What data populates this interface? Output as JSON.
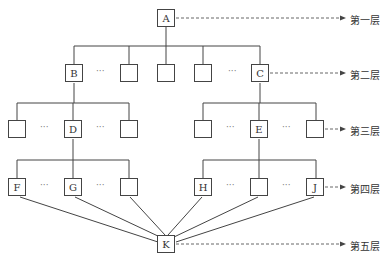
{
  "diagram": {
    "type": "hierarchy",
    "nodes": [
      {
        "id": "A",
        "label": "A",
        "x": 157,
        "y": 9
      },
      {
        "id": "B",
        "label": "B",
        "x": 65,
        "y": 64
      },
      {
        "id": "L2a",
        "label": "",
        "x": 120,
        "y": 64
      },
      {
        "id": "L2b",
        "label": "",
        "x": 157,
        "y": 64
      },
      {
        "id": "L2c",
        "label": "",
        "x": 194,
        "y": 64
      },
      {
        "id": "C",
        "label": "C",
        "x": 251,
        "y": 64
      },
      {
        "id": "L3a",
        "label": "",
        "x": 8,
        "y": 120
      },
      {
        "id": "D",
        "label": "D",
        "x": 64,
        "y": 120
      },
      {
        "id": "L3b",
        "label": "",
        "x": 120,
        "y": 120
      },
      {
        "id": "L3c",
        "label": "",
        "x": 194,
        "y": 120
      },
      {
        "id": "E",
        "label": "E",
        "x": 250,
        "y": 120
      },
      {
        "id": "L3d",
        "label": "",
        "x": 306,
        "y": 120
      },
      {
        "id": "F",
        "label": "F",
        "x": 8,
        "y": 178
      },
      {
        "id": "G",
        "label": "G",
        "x": 64,
        "y": 178
      },
      {
        "id": "L4a",
        "label": "",
        "x": 120,
        "y": 178
      },
      {
        "id": "H",
        "label": "H",
        "x": 194,
        "y": 178
      },
      {
        "id": "L4b",
        "label": "",
        "x": 250,
        "y": 178
      },
      {
        "id": "J",
        "label": "J",
        "x": 306,
        "y": 178
      },
      {
        "id": "K",
        "label": "K",
        "x": 157,
        "y": 235
      }
    ],
    "ellipses": [
      {
        "x": 96,
        "y": 66
      },
      {
        "x": 228,
        "y": 66
      },
      {
        "x": 40,
        "y": 122
      },
      {
        "x": 96,
        "y": 122
      },
      {
        "x": 226,
        "y": 122
      },
      {
        "x": 282,
        "y": 122
      },
      {
        "x": 40,
        "y": 180
      },
      {
        "x": 96,
        "y": 180
      },
      {
        "x": 226,
        "y": 180
      },
      {
        "x": 282,
        "y": 180
      }
    ],
    "ellipsis_text": "···",
    "levels": [
      {
        "label": "第一层",
        "y": 13
      },
      {
        "label": "第二层",
        "y": 68
      },
      {
        "label": "第三层",
        "y": 124
      },
      {
        "label": "第四层",
        "y": 182
      },
      {
        "label": "第五层",
        "y": 239
      }
    ]
  }
}
